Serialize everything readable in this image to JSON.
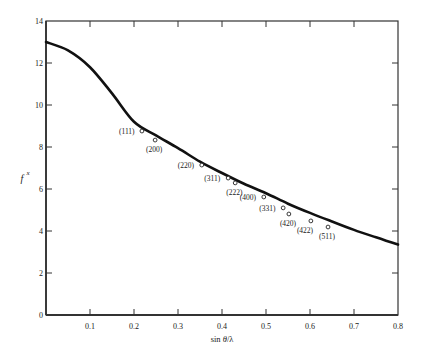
{
  "chart_data": {
    "type": "line",
    "title": "",
    "xlabel": "sin θ/λ",
    "ylabel": "f",
    "ylabel_superscript": "x",
    "xlim": [
      0,
      0.8
    ],
    "ylim": [
      0,
      14
    ],
    "xticks": [
      0.1,
      0.2,
      0.3,
      0.4,
      0.5,
      0.6,
      0.7,
      0.8
    ],
    "xtick_labels": [
      "0.1",
      "0.2",
      "0.3",
      "0.4",
      "0.5",
      "0.6",
      "0.7",
      "0.8"
    ],
    "yticks": [
      0,
      2,
      4,
      6,
      8,
      10,
      12,
      14
    ],
    "ytick_labels": [
      "0",
      "2",
      "4",
      "6",
      "8",
      "10",
      "12",
      "14"
    ],
    "grid": false,
    "legend": null,
    "series": [
      {
        "name": "theoretical curve",
        "style": "solid-line",
        "x": [
          0.0,
          0.05,
          0.1,
          0.15,
          0.2,
          0.25,
          0.3,
          0.35,
          0.4,
          0.45,
          0.5,
          0.55,
          0.6,
          0.65,
          0.7,
          0.75,
          0.8
        ],
        "y": [
          13.0,
          12.6,
          11.8,
          10.55,
          9.2,
          8.55,
          7.95,
          7.3,
          6.76,
          6.25,
          5.8,
          5.3,
          4.86,
          4.45,
          4.05,
          3.7,
          3.35
        ]
      },
      {
        "name": "measured reflections",
        "style": "open-circle",
        "points": [
          {
            "label": "(111)",
            "x": 0.218,
            "y": 8.76
          },
          {
            "label": "(200)",
            "x": 0.248,
            "y": 8.33
          },
          {
            "label": "(220)",
            "x": 0.354,
            "y": 7.14
          },
          {
            "label": "(311)",
            "x": 0.414,
            "y": 6.52
          },
          {
            "label": "(222)",
            "x": 0.43,
            "y": 6.29
          },
          {
            "label": "(400)",
            "x": 0.495,
            "y": 5.62
          },
          {
            "label": "(331)",
            "x": 0.539,
            "y": 5.1
          },
          {
            "label": "(420)",
            "x": 0.552,
            "y": 4.81
          },
          {
            "label": "(422)",
            "x": 0.602,
            "y": 4.48
          },
          {
            "label": "(511)",
            "x": 0.641,
            "y": 4.19
          }
        ]
      }
    ],
    "annotations": [
      "(111)",
      "(200)",
      "(220)",
      "(311)",
      "(222)",
      "(400)",
      "(331)",
      "(420)",
      "(422)",
      "(511)"
    ]
  },
  "layout": {
    "plot_left": 46,
    "plot_right": 398,
    "plot_top": 21,
    "plot_bottom": 315,
    "line_color": "#111111",
    "axis_color": "#333333",
    "label_offsets": {
      "(111)": {
        "dx": -23,
        "dy": 3,
        "anchor": "start"
      },
      "(200)": {
        "dx": -9,
        "dy": 12,
        "anchor": "start"
      },
      "(220)": {
        "dx": -24,
        "dy": 3,
        "anchor": "start"
      },
      "(311)": {
        "dx": -24,
        "dy": 3,
        "anchor": "start"
      },
      "(222)": {
        "dx": -9,
        "dy": 12,
        "anchor": "start"
      },
      "(400)": {
        "dx": -24,
        "dy": 3,
        "anchor": "start"
      },
      "(331)": {
        "dx": -24,
        "dy": 3,
        "anchor": "start"
      },
      "(420)": {
        "dx": -9,
        "dy": 12,
        "anchor": "start"
      },
      "(422)": {
        "dx": -14,
        "dy": 12,
        "anchor": "start"
      },
      "(511)": {
        "dx": -9,
        "dy": 12,
        "anchor": "start"
      }
    }
  }
}
